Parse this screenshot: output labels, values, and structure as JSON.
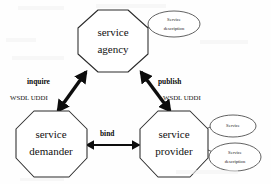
{
  "diagram": {
    "nodes": [
      {
        "id": "agency",
        "line1": "service",
        "line2": "agency",
        "shape": "octagon"
      },
      {
        "id": "demander",
        "line1": "service",
        "line2": "demander",
        "shape": "octagon"
      },
      {
        "id": "provider",
        "line1": "service",
        "line2": "provider",
        "shape": "octagon"
      }
    ],
    "artifacts": [
      {
        "id": "agency-description",
        "line1": "Service",
        "line2": "description",
        "attached_to": "agency",
        "shape": "ellipse"
      },
      {
        "id": "provider-service",
        "line1": "Service",
        "line2": "",
        "attached_to": "provider",
        "shape": "ellipse"
      },
      {
        "id": "provider-description",
        "line1": "Service",
        "line2": "description",
        "attached_to": "provider",
        "shape": "ellipse"
      }
    ],
    "edges": [
      {
        "id": "inquire",
        "label": "inquire",
        "sublabel": "WSDL UDDI",
        "from": "demander",
        "to": "agency",
        "style": "double-headed-thick"
      },
      {
        "id": "publish",
        "label": "publish",
        "sublabel": "WSDL UDDI",
        "from": "provider",
        "to": "agency",
        "style": "double-headed-thick"
      },
      {
        "id": "bind",
        "label": "bind",
        "sublabel": "",
        "from": "demander",
        "to": "provider",
        "style": "double-headed-thin"
      }
    ],
    "colors": {
      "background": "#fefefe",
      "node_stroke": "#2b2b2b",
      "node_fill": "#ffffff",
      "arrow": "#0d0d0d",
      "text": "#111111"
    }
  }
}
